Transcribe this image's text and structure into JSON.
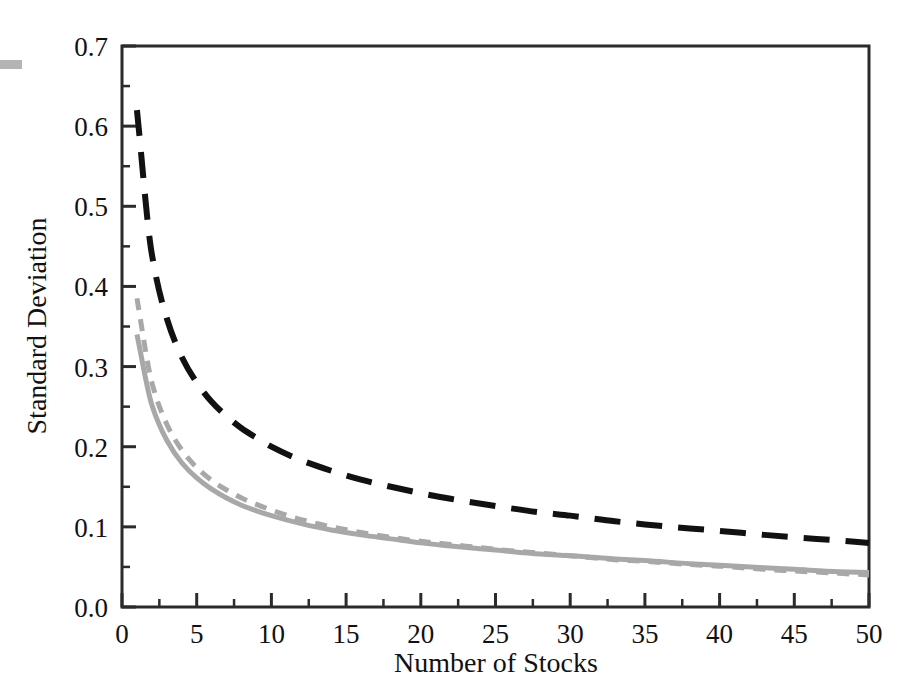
{
  "figure": {
    "background_color": "#ffffff",
    "frame_color": "#2b2b2b",
    "scan_artifact_color": "#b4b4b4"
  },
  "chart_data": {
    "type": "line",
    "title": "",
    "subtitle": "",
    "xlabel": "Number of Stocks",
    "ylabel": "Standard Deviation",
    "xlim": [
      0,
      50
    ],
    "ylim": [
      0.0,
      0.7
    ],
    "grid": false,
    "legend_position": "none",
    "x_ticks": [
      0,
      5,
      10,
      15,
      20,
      25,
      30,
      35,
      40,
      45,
      50
    ],
    "x_tick_labels": [
      "0",
      "5",
      "10",
      "15",
      "20",
      "25",
      "30",
      "35",
      "40",
      "45",
      "50"
    ],
    "x_minor_ticks": [
      2.5,
      7.5,
      12.5,
      17.5,
      22.5,
      27.5,
      32.5,
      37.5,
      42.5,
      47.5
    ],
    "y_ticks": [
      0.0,
      0.1,
      0.2,
      0.3,
      0.4,
      0.5,
      0.6,
      0.7
    ],
    "y_tick_labels": [
      "0.0",
      "0.1",
      "0.2",
      "0.3",
      "0.4",
      "0.5",
      "0.6",
      "0.7"
    ],
    "y_minor_ticks": [
      0.05,
      0.15,
      0.25,
      0.35,
      0.45,
      0.55,
      0.65
    ],
    "x": [
      1,
      2,
      3,
      4,
      5,
      6,
      7,
      8,
      9,
      10,
      12,
      14,
      16,
      18,
      20,
      22,
      25,
      28,
      30,
      33,
      35,
      38,
      40,
      43,
      45,
      48,
      50
    ],
    "series": [
      {
        "name": "upper-dashed-black",
        "color": "#111111",
        "style": "dashed",
        "width": 6,
        "values": [
          0.62,
          0.44,
          0.36,
          0.312,
          0.28,
          0.256,
          0.238,
          0.223,
          0.211,
          0.2,
          0.183,
          0.17,
          0.159,
          0.15,
          0.142,
          0.135,
          0.126,
          0.118,
          0.114,
          0.107,
          0.103,
          0.098,
          0.095,
          0.09,
          0.087,
          0.083,
          0.08
        ]
      },
      {
        "name": "middle-dashed-gray",
        "color": "#a8a8a8",
        "style": "dashed",
        "width": 5,
        "values": [
          0.385,
          0.28,
          0.228,
          0.196,
          0.174,
          0.158,
          0.146,
          0.136,
          0.128,
          0.121,
          0.109,
          0.1,
          0.093,
          0.087,
          0.082,
          0.078,
          0.072,
          0.067,
          0.064,
          0.059,
          0.057,
          0.053,
          0.051,
          0.047,
          0.045,
          0.042,
          0.04
        ]
      },
      {
        "name": "lower-solid-gray",
        "color": "#a8a8a8",
        "style": "solid",
        "width": 5,
        "values": [
          0.34,
          0.252,
          0.208,
          0.18,
          0.161,
          0.147,
          0.136,
          0.127,
          0.12,
          0.114,
          0.104,
          0.096,
          0.09,
          0.085,
          0.08,
          0.076,
          0.071,
          0.066,
          0.064,
          0.06,
          0.058,
          0.054,
          0.052,
          0.049,
          0.047,
          0.044,
          0.043
        ]
      }
    ],
    "annotations": []
  }
}
